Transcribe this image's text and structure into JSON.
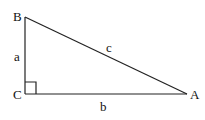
{
  "diagram": {
    "colors": {
      "stroke": "#222222",
      "text": "#111111",
      "background": "#ffffff"
    },
    "vertices": {
      "B": {
        "label": "B",
        "x": 25,
        "y": 17
      },
      "C": {
        "label": "C",
        "x": 25,
        "y": 94
      },
      "A": {
        "label": "A",
        "x": 187,
        "y": 94
      }
    },
    "sides": {
      "a": {
        "label": "a",
        "between": [
          "B",
          "C"
        ]
      },
      "b": {
        "label": "b",
        "between": [
          "C",
          "A"
        ]
      },
      "c": {
        "label": "c",
        "between": [
          "B",
          "A"
        ]
      }
    },
    "right_angle_at": "C"
  }
}
